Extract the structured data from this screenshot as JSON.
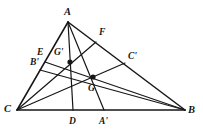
{
  "figure": {
    "kind": "geometry-diagram",
    "background_color": "#ffffff",
    "stroke_color": "#161616",
    "label_color": "#161616",
    "canvas": {
      "width": 203,
      "height": 135
    }
  },
  "points": {
    "A": {
      "label": "A",
      "x": 68,
      "y": 22,
      "label_x": 64,
      "label_y": 7
    },
    "B": {
      "label": "B",
      "x": 185,
      "y": 110,
      "label_x": 188,
      "label_y": 105
    },
    "C": {
      "label": "C",
      "x": 17,
      "y": 110,
      "label_x": 4,
      "label_y": 104
    },
    "D": {
      "label": "D",
      "x": 73,
      "y": 110,
      "label_x": 69,
      "label_y": 117
    },
    "Aprime": {
      "label": "A'",
      "x": 104,
      "y": 110,
      "label_x": 99,
      "label_y": 117
    },
    "E": {
      "label": "E",
      "x": 45,
      "y": 62,
      "label_x": 37,
      "label_y": 48
    },
    "Bprime": {
      "label": "B'",
      "x": 40,
      "y": 70,
      "label_x": 30,
      "label_y": 58
    },
    "F": {
      "label": "F",
      "x": 96,
      "y": 42,
      "label_x": 99,
      "label_y": 28
    },
    "Cprime": {
      "label": "C'",
      "x": 125,
      "y": 63,
      "label_x": 128,
      "label_y": 52
    },
    "Gprime": {
      "label": "G'",
      "x": 70,
      "y": 62,
      "label_x": 54,
      "label_y": 48
    },
    "G": {
      "label": "G",
      "x": 93,
      "y": 77,
      "label_x": 88,
      "label_y": 84
    }
  },
  "segments": [
    {
      "name": "side-AC",
      "from": "A",
      "to": "C",
      "width": 1.5
    },
    {
      "name": "side-AB",
      "from": "A",
      "to": "B",
      "width": 1.5
    },
    {
      "name": "side-CB",
      "from": "C",
      "to": "B",
      "width": 1.5
    },
    {
      "name": "cevian-A-D",
      "from": "A",
      "to": "D",
      "width": 1.2
    },
    {
      "name": "cevian-A-Aprime",
      "from": "A",
      "to": "Aprime",
      "width": 1.2
    },
    {
      "name": "cevian-C-F",
      "from": "C",
      "to": "F",
      "width": 1.2
    },
    {
      "name": "cevian-C-Cprime",
      "from": "C",
      "to": "Cprime",
      "width": 1.2
    },
    {
      "name": "cevian-B-E",
      "from": "B",
      "to": "E",
      "width": 1.2
    },
    {
      "name": "cevian-B-Bprime",
      "from": "B",
      "to": "Bprime",
      "width": 1.2
    }
  ],
  "markers": [
    {
      "name": "intersection-dot-Gprime",
      "point": "Gprime",
      "radius": 2.6
    },
    {
      "name": "intersection-dot-G",
      "point": "G",
      "radius": 2.6
    }
  ]
}
